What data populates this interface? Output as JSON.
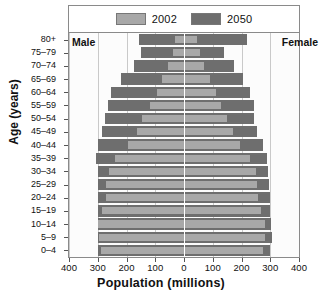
{
  "chart_data": {
    "type": "bar",
    "chart_subtype": "population-pyramid",
    "title": "",
    "xlabel": "Population (millions)",
    "ylabel": "Age (years)",
    "xlim": [
      -400,
      400
    ],
    "xticks": [
      400,
      300,
      200,
      100,
      0,
      100,
      200,
      300,
      400
    ],
    "xtick_labels": [
      "400",
      "300",
      "200",
      "100",
      "0",
      "100",
      "200",
      "300",
      "400"
    ],
    "grid": true,
    "legend_position": "top",
    "side_labels": {
      "left": "Male",
      "right": "Female"
    },
    "categories": [
      "80+",
      "75-79",
      "70-74",
      "65-69",
      "60-64",
      "55-59",
      "50-54",
      "45-49",
      "40-44",
      "35-39",
      "30-34",
      "25-29",
      "20-24",
      "15-19",
      "10-14",
      "5-9",
      "0-4"
    ],
    "series": [
      {
        "name": "2002",
        "color": "#a8a8a8",
        "male": [
          30,
          40,
          55,
          75,
          95,
          120,
          145,
          165,
          195,
          240,
          260,
          270,
          270,
          285,
          300,
          295,
          290
        ],
        "female": [
          45,
          55,
          70,
          90,
          110,
          130,
          150,
          170,
          195,
          230,
          250,
          255,
          258,
          268,
          282,
          280,
          275
        ]
      },
      {
        "name": "2050",
        "color": "#6e6e6e",
        "male": [
          155,
          150,
          175,
          220,
          255,
          265,
          275,
          285,
          300,
          305,
          300,
          298,
          300,
          298,
          300,
          298,
          298
        ],
        "female": [
          220,
          140,
          175,
          205,
          230,
          245,
          245,
          255,
          275,
          288,
          292,
          295,
          298,
          298,
          302,
          305,
          300
        ]
      }
    ],
    "legend": [
      {
        "label": "2002",
        "color": "#a8a8a8"
      },
      {
        "label": "2050",
        "color": "#6e6e6e"
      }
    ]
  },
  "colors": {
    "series_2002": "#a8a8a8",
    "series_2050": "#6e6e6e",
    "frame": "#8a8a8a",
    "grid": "#c9c9c9",
    "center_axis": "#ffffff",
    "background": "#ffffff",
    "text": "#111111"
  }
}
